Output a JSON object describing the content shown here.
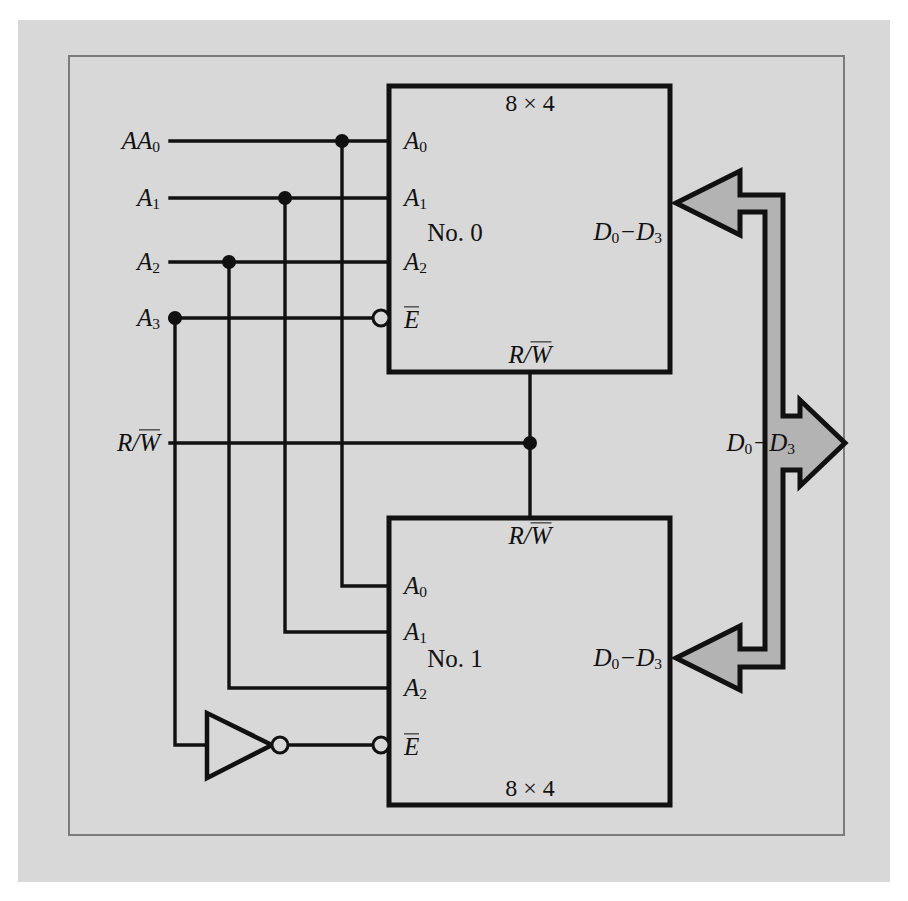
{
  "figure": {
    "type": "logic-circuit-diagram",
    "background_color": "#d8d8d8",
    "frame_color": "#7b7b7b",
    "line_color": "#111111",
    "bus_fill_color": "#b3b3b3"
  },
  "inputs": [
    {
      "id": "a0",
      "base": "A",
      "sub": "0",
      "y": 141
    },
    {
      "id": "a1",
      "base": "A",
      "sub": "1",
      "y": 198
    },
    {
      "id": "a2",
      "base": "A",
      "sub": "2",
      "y": 262
    },
    {
      "id": "a3",
      "base": "A",
      "sub": "3",
      "y": 318
    },
    {
      "id": "rw",
      "base": "R/W",
      "sub": "",
      "y": 443,
      "overline_tail": "W"
    }
  ],
  "input_labels": {
    "a0": "A0",
    "a1": "A1",
    "a2": "A2",
    "a3": "A3",
    "rw": "R/W"
  },
  "blocks": [
    {
      "id": "block0",
      "name": "No. 0",
      "size_top": "8 × 4",
      "size_bottom": "",
      "data_label": "D0−D3",
      "rw_label": "R/W",
      "pins": [
        {
          "label": "A0",
          "y": 141
        },
        {
          "label": "A1",
          "y": 198
        },
        {
          "label": "A2",
          "y": 262
        },
        {
          "label": "E",
          "y": 318,
          "bubble": true,
          "overline": true
        }
      ]
    },
    {
      "id": "block1",
      "name": "No. 1",
      "size_top": "",
      "size_bottom": "8 × 4",
      "data_label": "D0−D3",
      "rw_label": "R/W",
      "pins": [
        {
          "label": "A0",
          "y": 586
        },
        {
          "label": "A1",
          "y": 632
        },
        {
          "label": "A2",
          "y": 688
        },
        {
          "label": "E",
          "y": 745,
          "bubble": true,
          "overline": true
        }
      ]
    }
  ],
  "bus": {
    "label": "D0−D3",
    "direction_out": "right",
    "arrow_targets": [
      "block0-data",
      "block1-data",
      "external-out"
    ]
  },
  "gate": {
    "type": "inverter",
    "name": "NOT gate",
    "input_from": "A3",
    "output_to": "block1-enable"
  },
  "junction_dots": [
    {
      "signal": "A0",
      "x": 342,
      "y": 141
    },
    {
      "signal": "A1",
      "x": 285,
      "y": 198
    },
    {
      "signal": "A2",
      "x": 229,
      "y": 262
    },
    {
      "signal": "A3",
      "x": 175,
      "y": 318
    },
    {
      "signal": "R/W",
      "x": 530,
      "y": 443
    }
  ]
}
